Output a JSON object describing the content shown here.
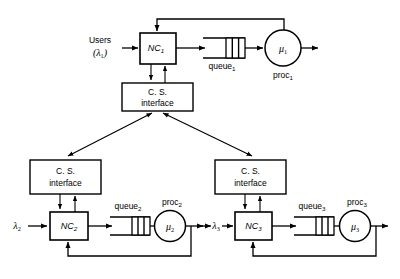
{
  "diagram": {
    "type": "block-flow-diagram",
    "colors": {
      "stroke": "#000000",
      "fill": "#ffffff",
      "background": "#ffffff"
    },
    "labels": {
      "users": "Users",
      "lambda1": "(λ",
      "lambda1_sub": "1",
      "lambda1_close": ")",
      "nc1": "NC",
      "nc1_sub": "1",
      "queue1": "queue",
      "queue1_sub": "1",
      "mu1": "μ",
      "mu1_sub": "1",
      "proc1": "proc",
      "proc1_sub": "1",
      "cs_top_line1": "C. S.",
      "cs_top_line2": "interface",
      "cs_left_line1": "C. S.",
      "cs_left_line2": "interface",
      "cs_right_line1": "C. S.",
      "cs_right_line2": "interface",
      "lambda2": "λ",
      "lambda2_sub": "2",
      "nc2": "NC",
      "nc2_sub": "2",
      "queue2": "queue",
      "queue2_sub": "2",
      "mu2": "μ",
      "mu2_sub": "2",
      "proc2": "proc",
      "proc2_sub": "2",
      "lambda3": "λ",
      "lambda3_sub": "3",
      "nc3": "NC",
      "nc3_sub": "3",
      "queue3": "queue",
      "queue3_sub": "3",
      "mu3": "μ",
      "mu3_sub": "3",
      "proc3": "proc",
      "proc3_sub": "3"
    },
    "nodes": [
      {
        "id": "nc1",
        "kind": "network-controller",
        "label": "NC1"
      },
      {
        "id": "nc2",
        "kind": "network-controller",
        "label": "NC2"
      },
      {
        "id": "nc3",
        "kind": "network-controller",
        "label": "NC3"
      },
      {
        "id": "cs-top",
        "kind": "cs-interface",
        "label": "C. S. interface"
      },
      {
        "id": "cs-left",
        "kind": "cs-interface",
        "label": "C. S. interface"
      },
      {
        "id": "cs-right",
        "kind": "cs-interface",
        "label": "C. S. interface"
      },
      {
        "id": "queue1",
        "kind": "queue",
        "label": "queue1",
        "slots": 3
      },
      {
        "id": "queue2",
        "kind": "queue",
        "label": "queue2",
        "slots": 3
      },
      {
        "id": "queue3",
        "kind": "queue",
        "label": "queue3",
        "slots": 3
      },
      {
        "id": "proc1",
        "kind": "processor",
        "label": "proc1",
        "rate": "μ1"
      },
      {
        "id": "proc2",
        "kind": "processor",
        "label": "proc2",
        "rate": "μ2"
      },
      {
        "id": "proc3",
        "kind": "processor",
        "label": "proc3",
        "rate": "μ3"
      }
    ]
  }
}
